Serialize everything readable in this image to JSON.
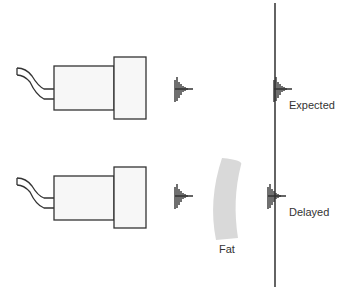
{
  "diagram": {
    "labels": {
      "expected": "Expected",
      "delayed": "Delayed",
      "fat": "Fat"
    },
    "components": {
      "top_transducer": "transducer",
      "bottom_transducer": "transducer",
      "reflector": "vertical-line",
      "fat_layer": "curved-band"
    },
    "colors": {
      "stroke": "#333333",
      "fill": "#f6f6f6",
      "fat": "#d9d9d9",
      "line": "#222222",
      "text": "#333333"
    }
  }
}
